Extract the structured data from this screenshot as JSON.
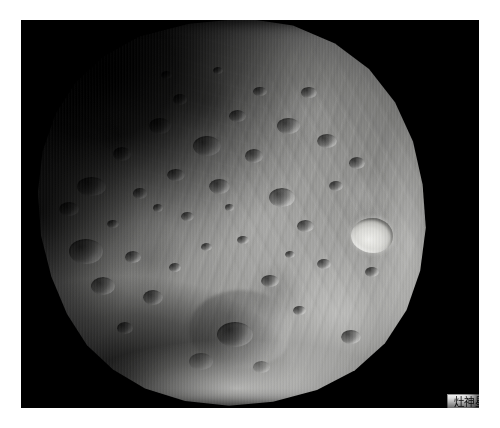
{
  "page": {
    "background_color": "#ffffff",
    "width": 500,
    "height": 428
  },
  "photo": {
    "name": "phobos-photograph",
    "sky_color": "#000000",
    "subject": "Phobos",
    "description": "Grayscale spacecraft photograph of a heavily cratered, irregular moon filling most of the frame against black space",
    "border_color": "#ffffff",
    "bounds": {
      "left": 21,
      "top": 20,
      "width": 458,
      "height": 388
    }
  },
  "body": {
    "name": "moon-body",
    "surface_color": "#8d8d8b",
    "highlight_color": "#e3e3e0",
    "shadow_color": "#17171a",
    "features": {
      "bright_crater": "bright-rimmed crater on right limb",
      "basin": "large shallow basin lower centre",
      "grooves": "parallel linear grooves across the right hemisphere"
    }
  },
  "label": {
    "name": "image-caption-label",
    "text": "灶神星",
    "background_color": "#ffffff",
    "border_color": "#9a9a9a",
    "text_color": "#101010"
  },
  "craters": [
    {
      "x": 12.0,
      "y": 41.0,
      "w": 7.2,
      "h": 5.0,
      "cls": "soft"
    },
    {
      "x": 7.5,
      "y": 47.5,
      "w": 5.0,
      "h": 3.6,
      "cls": "soft"
    },
    {
      "x": 10.0,
      "y": 57.0,
      "w": 8.4,
      "h": 6.2,
      "cls": "soft"
    },
    {
      "x": 15.5,
      "y": 66.5,
      "w": 6.0,
      "h": 4.6,
      "cls": "soft"
    },
    {
      "x": 21.0,
      "y": 33.5,
      "w": 4.6,
      "h": 3.4,
      "cls": "soft"
    },
    {
      "x": 26.0,
      "y": 44.0,
      "w": 3.4,
      "h": 2.6,
      "cls": "tiny"
    },
    {
      "x": 19.5,
      "y": 52.0,
      "w": 3.0,
      "h": 2.2,
      "cls": "tiny"
    },
    {
      "x": 24.0,
      "y": 60.0,
      "w": 4.0,
      "h": 3.0,
      "cls": "tiny"
    },
    {
      "x": 30.0,
      "y": 26.0,
      "w": 5.6,
      "h": 4.2,
      "cls": "soft"
    },
    {
      "x": 36.0,
      "y": 20.0,
      "w": 3.6,
      "h": 2.6,
      "cls": "tiny"
    },
    {
      "x": 41.0,
      "y": 30.5,
      "w": 7.0,
      "h": 5.2,
      "cls": "soft"
    },
    {
      "x": 34.5,
      "y": 39.0,
      "w": 4.4,
      "h": 3.2,
      "cls": "tiny"
    },
    {
      "x": 45.0,
      "y": 41.5,
      "w": 5.2,
      "h": 3.8,
      "cls": "soft"
    },
    {
      "x": 38.0,
      "y": 50.0,
      "w": 3.2,
      "h": 2.4,
      "cls": "tiny"
    },
    {
      "x": 31.0,
      "y": 48.0,
      "w": 2.6,
      "h": 2.0,
      "cls": "tiny"
    },
    {
      "x": 28.5,
      "y": 70.0,
      "w": 5.0,
      "h": 3.8,
      "cls": "soft"
    },
    {
      "x": 35.0,
      "y": 63.0,
      "w": 3.0,
      "h": 2.2,
      "cls": "tiny"
    },
    {
      "x": 43.0,
      "y": 58.0,
      "w": 2.8,
      "h": 2.0,
      "cls": "tiny"
    },
    {
      "x": 50.0,
      "y": 24.0,
      "w": 4.2,
      "h": 3.0,
      "cls": "tiny"
    },
    {
      "x": 56.0,
      "y": 18.0,
      "w": 3.4,
      "h": 2.4,
      "cls": "tiny"
    },
    {
      "x": 62.0,
      "y": 26.0,
      "w": 5.8,
      "h": 4.2,
      "cls": "soft"
    },
    {
      "x": 54.0,
      "y": 34.0,
      "w": 4.6,
      "h": 3.4,
      "cls": "tiny"
    },
    {
      "x": 68.0,
      "y": 18.0,
      "w": 4.0,
      "h": 3.0,
      "cls": "tiny"
    },
    {
      "x": 72.0,
      "y": 30.0,
      "w": 5.0,
      "h": 3.6,
      "cls": "soft"
    },
    {
      "x": 60.0,
      "y": 44.0,
      "w": 6.4,
      "h": 4.8,
      "cls": "soft"
    },
    {
      "x": 67.0,
      "y": 52.0,
      "w": 4.2,
      "h": 3.0,
      "cls": "tiny"
    },
    {
      "x": 75.0,
      "y": 42.0,
      "w": 3.6,
      "h": 2.6,
      "cls": "tiny"
    },
    {
      "x": 52.0,
      "y": 56.0,
      "w": 3.0,
      "h": 2.2,
      "cls": "tiny"
    },
    {
      "x": 58.0,
      "y": 66.0,
      "w": 4.4,
      "h": 3.2,
      "cls": "tiny"
    },
    {
      "x": 66.0,
      "y": 74.0,
      "w": 3.2,
      "h": 2.4,
      "cls": "tiny"
    },
    {
      "x": 47.0,
      "y": 78.0,
      "w": 9.0,
      "h": 6.4,
      "cls": "soft"
    },
    {
      "x": 40.0,
      "y": 86.0,
      "w": 6.0,
      "h": 4.4,
      "cls": "soft"
    },
    {
      "x": 56.0,
      "y": 88.0,
      "w": 4.2,
      "h": 3.0,
      "cls": "tiny"
    },
    {
      "x": 72.0,
      "y": 62.0,
      "w": 3.4,
      "h": 2.6,
      "cls": "tiny"
    },
    {
      "x": 80.0,
      "y": 36.0,
      "w": 4.0,
      "h": 3.0,
      "cls": "tiny"
    },
    {
      "x": 84.0,
      "y": 64.0,
      "w": 3.6,
      "h": 2.6,
      "cls": "tiny"
    },
    {
      "x": 78.0,
      "y": 80.0,
      "w": 5.0,
      "h": 3.6,
      "cls": "soft"
    },
    {
      "x": 33.0,
      "y": 14.0,
      "w": 2.8,
      "h": 2.0,
      "cls": "tiny"
    },
    {
      "x": 46.0,
      "y": 13.0,
      "w": 2.4,
      "h": 1.8,
      "cls": "tiny"
    },
    {
      "x": 64.0,
      "y": 60.0,
      "w": 2.4,
      "h": 1.8,
      "cls": "tiny"
    },
    {
      "x": 49.0,
      "y": 48.0,
      "w": 2.2,
      "h": 1.7,
      "cls": "tiny"
    },
    {
      "x": 22.0,
      "y": 78.0,
      "w": 4.0,
      "h": 3.0,
      "cls": "soft"
    }
  ]
}
